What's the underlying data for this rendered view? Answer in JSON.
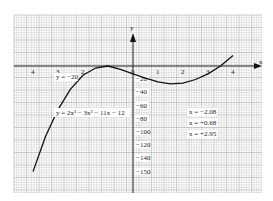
{
  "chart_data": {
    "type": "line",
    "title": "",
    "xlabel": "x",
    "ylabel": "y",
    "equation_label": "y = 2x³ − 3x² − 11x − 12",
    "annotation_y": "y = −20",
    "roots": [
      "x = −2.08",
      "x = +0.68",
      "x = +2.95"
    ],
    "x_ticks": [
      "4",
      "3",
      "2",
      "0",
      "1",
      "2",
      "3",
      "4"
    ],
    "x_tick_values": [
      -4,
      -3,
      -2,
      0,
      1,
      2,
      3,
      4
    ],
    "y_ticks": [
      "−20",
      "−40",
      "−60",
      "−80",
      "−100",
      "−120",
      "−140",
      "−150"
    ],
    "y_tick_values": [
      -20,
      -40,
      -60,
      -80,
      -100,
      -120,
      -140,
      -160
    ],
    "xlim": [
      -4.8,
      5.0
    ],
    "ylim": [
      -190,
      80
    ],
    "grid": true,
    "series": [
      {
        "name": "y = 2x³ − 3x² − 11x − 12",
        "x": [
          -4.0,
          -3.5,
          -3.0,
          -2.5,
          -2.0,
          -1.5,
          -1.0,
          -0.5,
          0.0,
          0.5,
          1.0,
          1.5,
          2.0,
          2.5,
          3.0,
          3.5,
          4.0
        ],
        "values": [
          -160,
          -107,
          -66,
          -35,
          -14,
          -3,
          0,
          -5,
          -12,
          -18.5,
          -24,
          -27,
          -26,
          -20.5,
          -12,
          0,
          16
        ]
      }
    ],
    "colors": {
      "grid_major": "#9a9a9a",
      "grid_minor": "#cfcfcf",
      "curve": "#111111",
      "axis": "#222222"
    }
  }
}
